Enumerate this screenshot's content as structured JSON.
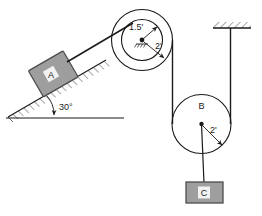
{
  "diagram": {
    "colors": {
      "stroke": "#1a1a1a",
      "block_fill": "#9e9e9e",
      "block_stroke": "#4d4d4d",
      "label_text": "#1a1a1a",
      "block_label_text": "#ffffff",
      "hatch": "#4d4d4d",
      "background": "#ffffff"
    },
    "blocks": [
      {
        "id": "A",
        "label": "A",
        "position": "on-incline"
      },
      {
        "id": "C",
        "label": "C",
        "position": "hanging"
      }
    ],
    "pulleys": [
      {
        "id": "top",
        "label": "",
        "inner_radius_label": "1.5'",
        "outer_radius_label": "2'"
      },
      {
        "id": "B",
        "label": "B",
        "radius_label": "2'"
      }
    ],
    "angles": [
      {
        "id": "incline",
        "label": "30°"
      }
    ],
    "supports": [
      {
        "id": "ceiling",
        "type": "hatched-fixed-support"
      },
      {
        "id": "incline-surface",
        "type": "hatched-incline"
      }
    ]
  }
}
